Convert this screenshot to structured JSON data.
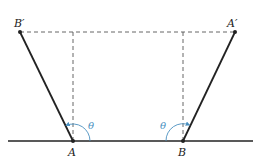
{
  "figure": {
    "points": {
      "B_prime": {
        "label": "B′",
        "x": 20,
        "y": 32
      },
      "A_prime": {
        "label": "A′",
        "x": 235,
        "y": 32
      },
      "A": {
        "label": "A",
        "x": 73,
        "y": 141
      },
      "B": {
        "label": "B",
        "x": 183,
        "y": 141
      }
    },
    "ground": {
      "x1": 8,
      "x2": 253,
      "y": 141
    },
    "angles": [
      {
        "label": "θ",
        "vertex": "A"
      },
      {
        "label": "θ",
        "vertex": "B"
      }
    ],
    "colors": {
      "line": "#222222",
      "dash": "#555555",
      "arc": "#4a90c0"
    }
  }
}
